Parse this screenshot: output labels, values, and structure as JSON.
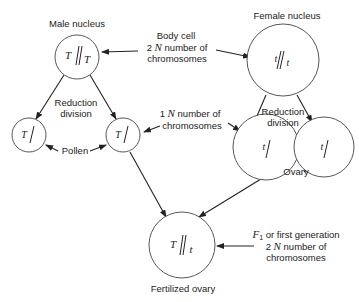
{
  "diagram": {
    "nodes": {
      "male_nucleus": {
        "label": "Male nucleus",
        "allele_left": "T",
        "allele_right": "T"
      },
      "female_nucleus": {
        "label": "Female nucleus",
        "allele_left": "t",
        "allele_right": "t"
      },
      "pollen_left": {
        "allele": "T"
      },
      "pollen_right": {
        "allele": "T"
      },
      "ovary_left": {
        "allele": "t"
      },
      "ovary_right": {
        "allele": "t"
      },
      "fertilized_ovary": {
        "label": "Fertilized ovary",
        "allele_left": "T",
        "allele_right": "t"
      }
    },
    "annotations": {
      "body_cell": {
        "line1": "Body cell",
        "line2_num": "2",
        "line2_var": "N",
        "line2_rest": "number of",
        "line3": "chromosomes"
      },
      "one_n": {
        "line1_num": "1",
        "line1_var": "N",
        "line1_rest": "number of",
        "line2": "chromosomes"
      },
      "reduction_left": {
        "line1": "Reduction",
        "line2": "division"
      },
      "reduction_right": {
        "line1": "Reduction",
        "line2": "division"
      },
      "pollen": "Pollen",
      "ovary": "Ovary",
      "f1": {
        "line1_var": "F",
        "line1_sub": "1",
        "line1_rest": "or first generation",
        "line2_num": "2",
        "line2_var": "N",
        "line2_rest": "number of",
        "line3": "chromosomes"
      }
    }
  }
}
